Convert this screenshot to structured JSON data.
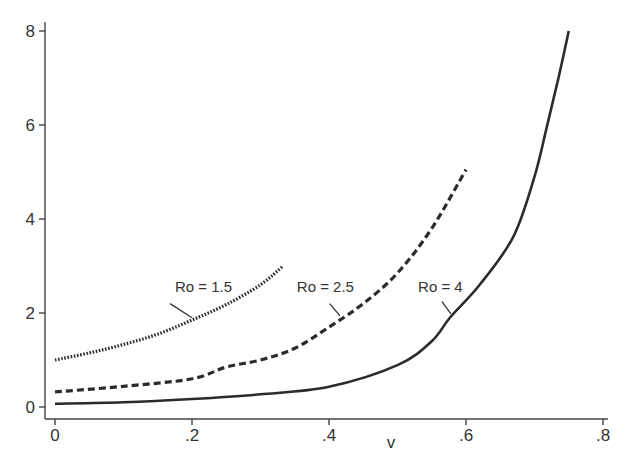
{
  "chart_data": {
    "type": "line",
    "title": "",
    "xlabel": "v",
    "ylabel": "",
    "xlim": [
      0,
      0.8
    ],
    "ylim": [
      0,
      8
    ],
    "grid": false,
    "legend": "none (inline labels)",
    "x_ticks": [
      {
        "value": 0,
        "label": "0"
      },
      {
        "value": 0.2,
        "label": ".2"
      },
      {
        "value": 0.4,
        "label": ".4"
      },
      {
        "value": 0.6,
        "label": ".6"
      },
      {
        "value": 0.8,
        "label": ".8"
      }
    ],
    "y_ticks": [
      {
        "value": 0,
        "label": "0"
      },
      {
        "value": 2,
        "label": "2"
      },
      {
        "value": 4,
        "label": "4"
      },
      {
        "value": 6,
        "label": "6"
      },
      {
        "value": 8,
        "label": "8"
      }
    ],
    "series": [
      {
        "name": "Ro = 1.5",
        "style": "dotted",
        "x": [
          0,
          0.05,
          0.1,
          0.15,
          0.2,
          0.25,
          0.3,
          0.333
        ],
        "y": [
          1.0,
          1.15,
          1.33,
          1.55,
          1.85,
          2.18,
          2.6,
          3.0
        ],
        "label_pos": {
          "v": 0.175,
          "y": 2.45
        },
        "leader": [
          [
            0.168,
            2.2
          ],
          [
            0.2,
            1.9
          ]
        ]
      },
      {
        "name": "Ro = 2.5",
        "style": "dashed",
        "x": [
          0,
          0.1,
          0.2,
          0.25,
          0.3,
          0.35,
          0.4,
          0.45,
          0.5,
          0.55,
          0.6
        ],
        "y": [
          0.32,
          0.44,
          0.6,
          0.85,
          1.0,
          1.25,
          1.7,
          2.2,
          2.85,
          3.8,
          5.05
        ],
        "label_pos": {
          "v": 0.353,
          "y": 2.45
        },
        "leader": [
          [
            0.401,
            2.2
          ],
          [
            0.416,
            1.94
          ]
        ]
      },
      {
        "name": "Ro = 4",
        "style": "solid",
        "x": [
          0,
          0.1,
          0.2,
          0.3,
          0.4,
          0.5,
          0.55,
          0.577,
          0.62,
          0.669,
          0.7,
          0.718,
          0.735,
          0.75
        ],
        "y": [
          0.07,
          0.1,
          0.17,
          0.27,
          0.43,
          0.89,
          1.4,
          1.91,
          2.6,
          3.62,
          4.9,
          5.96,
          7.0,
          8.0
        ],
        "label_pos": {
          "v": 0.53,
          "y": 2.45
        },
        "leader": [
          [
            0.565,
            2.24
          ],
          [
            0.578,
            1.98
          ]
        ]
      }
    ]
  },
  "axes": {
    "x_title": "v"
  }
}
